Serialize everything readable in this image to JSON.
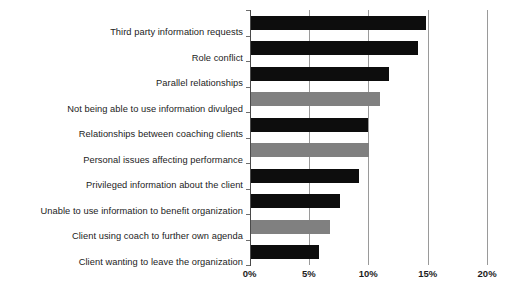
{
  "chart_data": {
    "type": "bar",
    "orientation": "horizontal",
    "title": "",
    "subtitle": "",
    "xlabel": "",
    "ylabel": "",
    "xlim": [
      0,
      20
    ],
    "xtick_labels": [
      "0%",
      "5%",
      "10%",
      "15%",
      "20%"
    ],
    "xtick_values": [
      0,
      5,
      10,
      15,
      20
    ],
    "grid": true,
    "legend": null,
    "value_suffix": "%",
    "categories": [
      "Third party information requests",
      "Role conflict",
      "Parallel relationships",
      "Not being able to use information divulged",
      "Relationships between coaching clients",
      "Personal issues affecting performance",
      "Privileged information about the client",
      "Unable to use information to benefit organization",
      "Client using coach to further own agenda",
      "Client wanting to leave the organization"
    ],
    "values": [
      14.8,
      14.1,
      11.7,
      10.9,
      9.9,
      10.0,
      9.1,
      7.5,
      6.7,
      5.8
    ],
    "bar_colors": [
      "#0d0d0d",
      "#0d0d0d",
      "#0d0d0d",
      "#808080",
      "#0d0d0d",
      "#808080",
      "#0d0d0d",
      "#0d0d0d",
      "#808080",
      "#0d0d0d"
    ],
    "colors": {
      "dark_bar": "#0d0d0d",
      "gray_bar": "#808080",
      "gridline": "#9a9a9a",
      "axis": "#4a4a4a",
      "background": "#ffffff",
      "text": "#1c1c1c"
    }
  }
}
